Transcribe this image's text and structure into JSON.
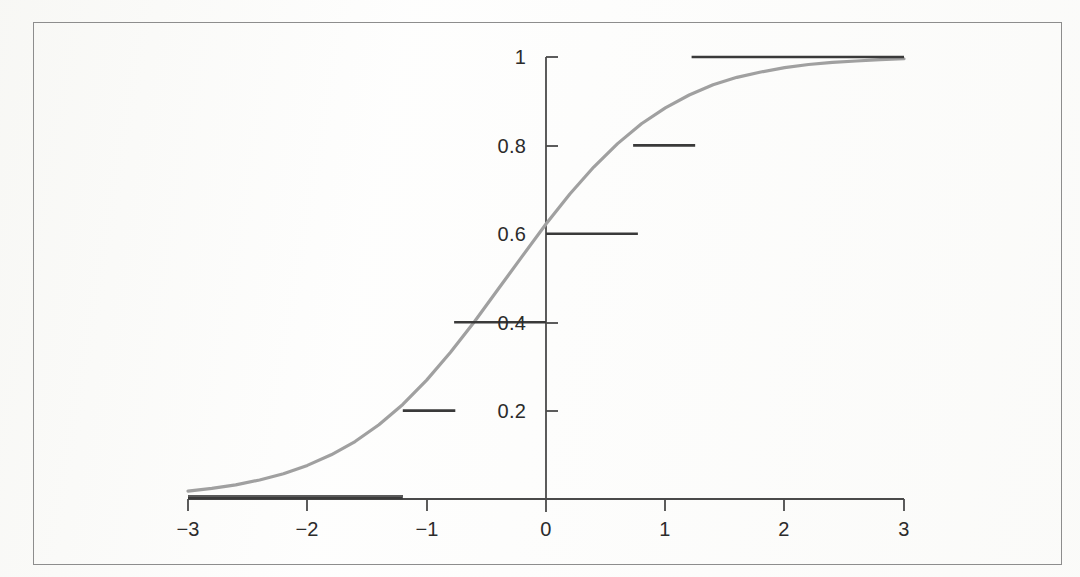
{
  "figure": {
    "kind": "scanned-plot",
    "frame_color": "#8d8d8d",
    "background_color": "#fdfdfc"
  },
  "chart_data": {
    "type": "line",
    "title": "",
    "subtitle": "",
    "xlabel": "",
    "ylabel": "",
    "xlim": [
      -3,
      3
    ],
    "ylim": [
      0,
      1
    ],
    "grid": false,
    "legend": false,
    "legend_position": "none",
    "axes": {
      "x_axis_position_y": 0,
      "y_axis_position_x": 0,
      "x_ticks": [
        -3,
        -2,
        -1,
        0,
        1,
        2,
        3
      ],
      "x_tick_labels": [
        "−3",
        "−2",
        "−1",
        "0",
        "1",
        "2",
        "3"
      ],
      "y_ticks": [
        0.2,
        0.4,
        0.6,
        0.8,
        1
      ],
      "y_tick_labels": [
        "0.2",
        "0.4",
        "0.6",
        "0.8",
        "1"
      ]
    },
    "series": [
      {
        "name": "logistic-curve",
        "type": "line",
        "color": "#a0a0a0",
        "linewidth": 3.2,
        "x": [
          -3.0,
          -2.8,
          -2.6,
          -2.4,
          -2.2,
          -2.0,
          -1.8,
          -1.6,
          -1.4,
          -1.2,
          -1.0,
          -0.8,
          -0.6,
          -0.4,
          -0.2,
          0.0,
          0.2,
          0.4,
          0.6,
          0.8,
          1.0,
          1.2,
          1.4,
          1.6,
          1.8,
          2.0,
          2.2,
          2.4,
          2.6,
          2.8,
          3.0
        ],
        "y": [
          0.018,
          0.024,
          0.032,
          0.043,
          0.057,
          0.076,
          0.1,
          0.13,
          0.168,
          0.214,
          0.269,
          0.332,
          0.401,
          0.475,
          0.549,
          0.622,
          0.69,
          0.751,
          0.804,
          0.849,
          0.885,
          0.914,
          0.937,
          0.954,
          0.966,
          0.976,
          0.983,
          0.988,
          0.991,
          0.994,
          0.996
        ]
      },
      {
        "name": "step-function",
        "type": "step-segments",
        "color": "#3a3a3a",
        "linewidth": 2.4,
        "segments": [
          {
            "label": "step-0",
            "y": 0.0,
            "x_start": -3.0,
            "x_end": -1.2
          },
          {
            "label": "step-0.2",
            "y": 0.2,
            "x_start": -1.2,
            "x_end": -0.76
          },
          {
            "label": "step-0.4",
            "y": 0.4,
            "x_start": -0.77,
            "x_end": 0.0
          },
          {
            "label": "step-0.6",
            "y": 0.6,
            "x_start": 0.0,
            "x_end": 0.77
          },
          {
            "label": "step-0.8",
            "y": 0.8,
            "x_start": 0.73,
            "x_end": 1.25
          },
          {
            "label": "step-1",
            "y": 1.0,
            "x_start": 1.22,
            "x_end": 3.0
          }
        ]
      }
    ]
  }
}
